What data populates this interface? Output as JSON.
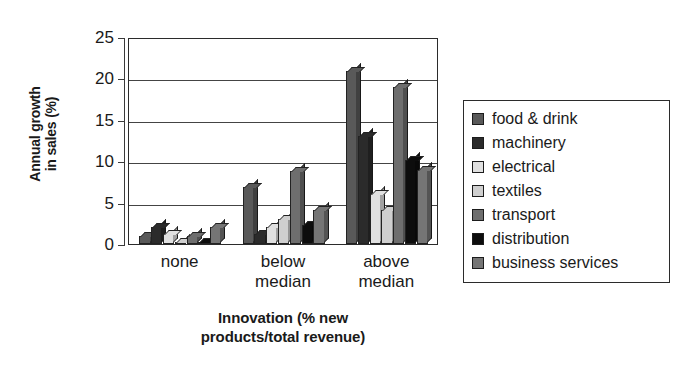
{
  "chart_data": {
    "type": "bar",
    "title": "",
    "subtitle": "",
    "xlabel": "Innovation (% new\nproducts/total revenue)",
    "ylabel": "Annual growth\nin sales (%)",
    "categories": [
      "none",
      "below\nmedian",
      "above\nmedian"
    ],
    "ylim": [
      0,
      25
    ],
    "yticks": [
      0,
      5,
      10,
      15,
      20,
      25
    ],
    "ytick_labels": [
      "0",
      "5",
      "10",
      "15",
      "20",
      "25"
    ],
    "grid": "horizontal",
    "legend_position": "right",
    "series": [
      {
        "name": "food & drink",
        "color": "#595959",
        "values": [
          1.0,
          6.9,
          20.9
        ]
      },
      {
        "name": "machinery",
        "color": "#2b2b2b",
        "values": [
          2.0,
          1.2,
          13.1
        ]
      },
      {
        "name": "electrical",
        "color": "#e0e0e0",
        "values": [
          1.2,
          2.0,
          6.0
        ]
      },
      {
        "name": "textiles",
        "color": "#cfcfcf",
        "values": [
          0.2,
          3.0,
          4.1
        ]
      },
      {
        "name": "transport",
        "color": "#6e6e6e",
        "values": [
          1.0,
          8.8,
          19.0
        ]
      },
      {
        "name": "distribution",
        "color": "#0d0d0d",
        "values": [
          0.2,
          2.3,
          10.2
        ]
      },
      {
        "name": "business services",
        "color": "#757575",
        "values": [
          2.0,
          4.1,
          8.9
        ]
      }
    ]
  },
  "legend": {
    "items": [
      {
        "label": "food & drink"
      },
      {
        "label": "machinery"
      },
      {
        "label": "electrical"
      },
      {
        "label": "textiles"
      },
      {
        "label": "transport"
      },
      {
        "label": "distribution"
      },
      {
        "label": "business services"
      }
    ]
  }
}
